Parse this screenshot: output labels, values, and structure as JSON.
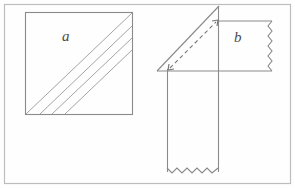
{
  "figure": {
    "background_color": "#fefefe",
    "frame": {
      "stroke": "#b9b9b9",
      "x": 4,
      "y": 4,
      "width": 287,
      "height": 180
    },
    "ink_color": "#6e6e6e",
    "ink_color_dark": "#5a5a5a",
    "labels": [
      {
        "id": "a",
        "text": "a",
        "x": 62,
        "y": 28
      },
      {
        "id": "b",
        "text": "b",
        "x": 234,
        "y": 29
      }
    ],
    "left_shape": {
      "name": "hatched-square",
      "x": 25,
      "y": 12,
      "width": 108,
      "height": 103,
      "hatch_direction": "bottom-left-to-top-right",
      "hatch_line_count": 4
    },
    "right_shape": {
      "name": "folded-strip-with-triangle",
      "triangle": {
        "apex_x": 219,
        "apex_y": 6,
        "left_x": 157,
        "base_y": 71
      },
      "dashed_arrow": {
        "from_x": 169,
        "from_y": 69,
        "to_x": 217,
        "to_y": 21,
        "double_headed": true,
        "dash_pattern": "4 3"
      },
      "rectangle_b": {
        "x": 219,
        "y": 21,
        "right_x": 272,
        "bottom_y": 71,
        "torn_edge": "right",
        "torn_edge_style": "zigzag"
      },
      "vertical_strip": {
        "left_x": 167,
        "right_x": 218,
        "top_y": 71,
        "bottom_y": 172,
        "torn_edge": "bottom",
        "torn_edge_style": "zigzag"
      },
      "baseline": {
        "from_x": 157,
        "to_x": 272,
        "y": 71
      }
    }
  }
}
